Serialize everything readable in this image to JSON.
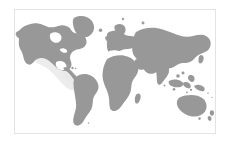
{
  "widget": {
    "name": "world-map",
    "type": "choropleth-world-map",
    "has_visible_text": false,
    "frame": {
      "x": 14,
      "y": 9,
      "width": 202,
      "height": 125,
      "border_color": "#e3e3e3",
      "border_width_px": 1
    }
  },
  "colors": {
    "page_background": "#ffffff",
    "ocean": "#ffffff",
    "land": "#989898",
    "land_stipple": "#9d9d9d",
    "highlight_region": "#e9e9e9",
    "frame_border": "#e3e3e3"
  },
  "projection": {
    "type": "equirectangular",
    "lon_range": [
      -180,
      180
    ],
    "lat_range": [
      -60,
      84
    ]
  },
  "regions": [
    {
      "id": "north-america",
      "label": "North America",
      "state": "default"
    },
    {
      "id": "greenland",
      "label": "Greenland",
      "state": "default"
    },
    {
      "id": "south-america",
      "label": "South America",
      "state": "default"
    },
    {
      "id": "europe",
      "label": "Europe",
      "state": "default"
    },
    {
      "id": "africa",
      "label": "Africa",
      "state": "default"
    },
    {
      "id": "asia",
      "label": "Asia",
      "state": "default"
    },
    {
      "id": "southeast-asia-islands",
      "label": "Southeast Asia Islands",
      "state": "default"
    },
    {
      "id": "australia",
      "label": "Australia",
      "state": "default"
    },
    {
      "id": "new-zealand",
      "label": "New Zealand",
      "state": "default"
    },
    {
      "id": "madagascar",
      "label": "Madagascar",
      "state": "default"
    },
    {
      "id": "japan",
      "label": "Japan",
      "state": "default"
    },
    {
      "id": "british-isles",
      "label": "British Isles",
      "state": "default"
    }
  ],
  "highlight": {
    "id": "central-america-pacific-highlight",
    "label": "Central America / Pacific Coast",
    "state": "highlighted",
    "color": "#e9e9e9"
  },
  "labels": {
    "title": "",
    "legend": "",
    "tooltip": ""
  }
}
